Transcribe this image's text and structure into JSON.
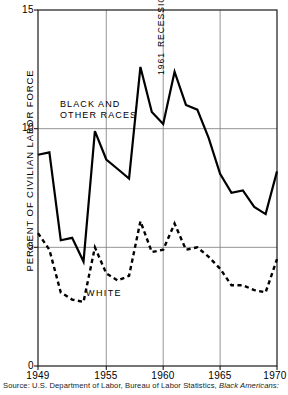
{
  "chart_data": {
    "type": "line",
    "title": "",
    "xlabel": "",
    "ylabel": "PERCENT OF CIVILIAN LABOR FORCE",
    "xlim": [
      1949,
      1970
    ],
    "ylim": [
      0,
      15
    ],
    "grid": true,
    "legend_position": "inline-annotations",
    "yticks": [
      0,
      5,
      10,
      15
    ],
    "ytick_labels": [
      "0",
      "5",
      "10",
      "15"
    ],
    "xticks": [
      1949,
      1955,
      1960,
      1965,
      1970
    ],
    "xtick_labels": [
      "1949",
      "1955",
      "1960",
      "1965",
      "1970"
    ],
    "x": [
      1949,
      1950,
      1951,
      1952,
      1953,
      1954,
      1955,
      1956,
      1957,
      1958,
      1959,
      1960,
      1961,
      1962,
      1963,
      1964,
      1965,
      1966,
      1967,
      1968,
      1969,
      1970
    ],
    "series": [
      {
        "name": "BLACK AND OTHER RACES",
        "style": "solid",
        "color": "#000000",
        "values": [
          8.9,
          9.0,
          5.3,
          5.4,
          4.4,
          9.9,
          8.7,
          8.3,
          7.9,
          12.6,
          10.7,
          10.2,
          12.4,
          11.0,
          10.8,
          9.6,
          8.1,
          7.3,
          7.4,
          6.7,
          6.4,
          8.2
        ]
      },
      {
        "name": "WHITE",
        "style": "dashed",
        "color": "#000000",
        "values": [
          5.6,
          4.9,
          3.1,
          2.8,
          2.7,
          5.0,
          3.9,
          3.6,
          3.8,
          6.1,
          4.8,
          4.9,
          6.0,
          4.9,
          5.0,
          4.6,
          4.1,
          3.4,
          3.4,
          3.2,
          3.1,
          4.5
        ]
      }
    ],
    "annotations": [
      {
        "text_line1": "BLACK AND",
        "text_line2": "OTHER RACES",
        "x": 1953.6,
        "y": 11.4
      },
      {
        "text_line1": "1961",
        "text_line2": "RECESSION",
        "x": 1961.0,
        "y": 14.2,
        "rotation": 90
      },
      {
        "text_line1": "WHITE",
        "x": 1956.0,
        "y": 2.9
      }
    ]
  },
  "axis": {
    "y_title": "PERCENT OF CIVILIAN LABOR FORCE",
    "y_labels": [
      "15",
      "10",
      "5",
      "0"
    ],
    "x_labels": [
      "1949",
      "1955",
      "1960",
      "1965",
      "1970"
    ]
  },
  "labels": {
    "black_other_races_line1": "BLACK AND",
    "black_other_races_line2": "OTHER RACES",
    "recession_year": "1961",
    "recession_word": "RECESSION",
    "white": "WHITE"
  },
  "source": {
    "prefix": "Source: U.S. Department of Labor, Bureau of Labor Statistics,",
    "italic": "Black Americans:"
  }
}
